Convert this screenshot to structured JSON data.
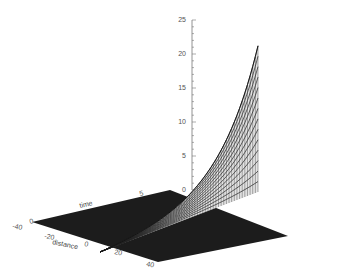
{
  "chart_data": {
    "type": "surface",
    "title": "",
    "xlabel": "distance",
    "ylabel": "time",
    "zlabel": "",
    "z_ticks": [
      0,
      5,
      10,
      15,
      20,
      25
    ],
    "z_range": [
      0,
      25
    ],
    "x_ticks": [
      "-40",
      "-20",
      "0",
      "20",
      "40"
    ],
    "y_ticks": [
      "0",
      "5"
    ],
    "surface_description": "Exponential growth along one edge; floor near zero elsewhere",
    "peak_value": 21.5,
    "floor_color": "#1a1a1a",
    "mesh_color": "#333333"
  },
  "labels": {
    "z_ticks": [
      "0",
      "5",
      "10",
      "15",
      "20",
      "25"
    ],
    "x_axis_title": "distance",
    "y_axis_title": "time",
    "x_ticks": [
      "-40",
      "-20",
      "0",
      "20",
      "40"
    ],
    "y_ticks": [
      "0",
      "5"
    ]
  }
}
